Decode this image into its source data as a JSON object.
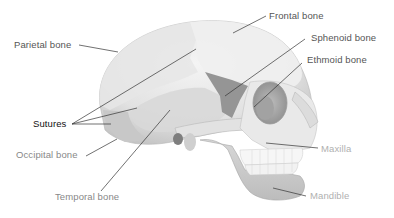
{
  "diagram": {
    "labels": {
      "parietal": "Parietal bone",
      "frontal": "Frontal bone",
      "sphenoid": "Sphenoid bone",
      "ethmoid": "Ethmoid bone",
      "sutures": "Sutures",
      "occipital": "Occipital bone",
      "temporal": "Temporal bone",
      "maxilla": "Maxilla",
      "mandible": "Mandible"
    },
    "colors": {
      "bone_light": "#ececec",
      "bone_mid": "#d2d2d2",
      "bone_dark": "#a8a8a8",
      "sphenoid_shade": "#8f8f8f",
      "leader_line": "#333333",
      "teeth": "#f6f6f6"
    }
  }
}
